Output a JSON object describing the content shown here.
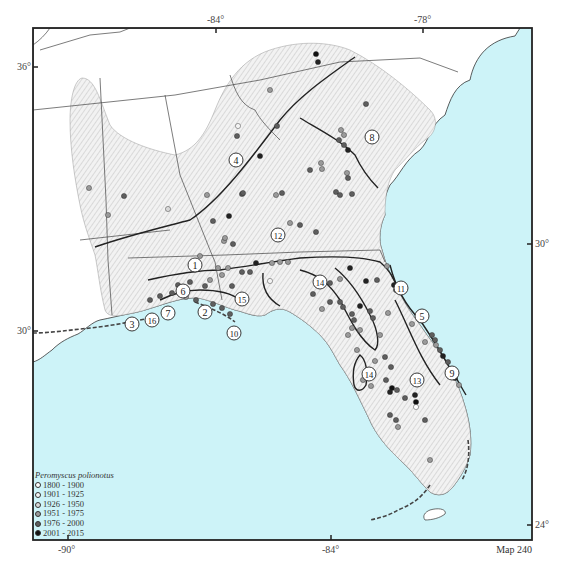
{
  "map": {
    "title": "Map 240",
    "species": "Peromyscus polionotus",
    "colors": {
      "water": "#cdf3f8",
      "range_fill": "#e8e8e8",
      "hatch": "#b8b8b8",
      "frame": "#222222",
      "boundary": "#333333"
    },
    "axes": {
      "top_ticks": [
        {
          "label": "-84°",
          "x": 216
        },
        {
          "label": "-78°",
          "x": 423
        }
      ],
      "bottom_ticks": [
        {
          "label": "-90°",
          "x": 68
        },
        {
          "label": "-84°",
          "x": 331
        }
      ],
      "left_ticks": [
        {
          "label": "36°",
          "y": 67
        },
        {
          "label": "30°",
          "y": 331
        }
      ],
      "right_ticks": [
        {
          "label": "30°",
          "y": 244
        },
        {
          "label": "24°",
          "y": 525
        }
      ]
    },
    "legend": {
      "title": "Peromyscus polionotus",
      "items": [
        {
          "label": "1800 - 1900",
          "color": "#ffffff"
        },
        {
          "label": "1901 - 1925",
          "color": "#f4f4f4"
        },
        {
          "label": "1926 - 1950",
          "color": "#d8d8d8"
        },
        {
          "label": "1951 - 1975",
          "color": "#9a9a9a"
        },
        {
          "label": "1976 - 2000",
          "color": "#5e5e5e"
        },
        {
          "label": "2001 - 2015",
          "color": "#111111"
        }
      ]
    },
    "subspecies_labels": [
      {
        "n": "1",
        "x": 195,
        "y": 265
      },
      {
        "n": "2",
        "x": 205,
        "y": 312
      },
      {
        "n": "3",
        "x": 132,
        "y": 324
      },
      {
        "n": "4",
        "x": 236,
        "y": 160
      },
      {
        "n": "5",
        "x": 422,
        "y": 316
      },
      {
        "n": "6",
        "x": 183,
        "y": 291
      },
      {
        "n": "7",
        "x": 168,
        "y": 313
      },
      {
        "n": "8",
        "x": 372,
        "y": 137
      },
      {
        "n": "9",
        "x": 452,
        "y": 373
      },
      {
        "n": "10",
        "x": 234,
        "y": 333
      },
      {
        "n": "11",
        "x": 401,
        "y": 288
      },
      {
        "n": "12",
        "x": 278,
        "y": 235
      },
      {
        "n": "13",
        "x": 417,
        "y": 380
      },
      {
        "n": "14",
        "x": 320,
        "y": 282
      },
      {
        "n": "14",
        "x": 369,
        "y": 374
      },
      {
        "n": "15",
        "x": 242,
        "y": 299
      },
      {
        "n": "16",
        "x": 152,
        "y": 320
      }
    ]
  }
}
